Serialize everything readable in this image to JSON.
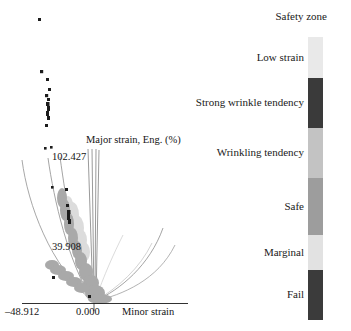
{
  "chart_data": {
    "type": "scatter",
    "title": "",
    "xlabel": "Minor strain",
    "ylabel": "Major strain, Eng. (%)",
    "axis_titles": {
      "x": "Minor strain",
      "y": "Major strain, Eng. (%)"
    },
    "x_ticks": [
      "–48.912",
      "0.000"
    ],
    "y_ticks": [
      "102.427",
      "39.908"
    ],
    "xlim": [
      -48.912,
      0.0
    ],
    "ylim": [
      0.0,
      102.427
    ],
    "grid": false,
    "legend_position": "right",
    "series": [
      {
        "name": "Fail (black points)",
        "color": "#1c1c1c",
        "points": [
          [
            -38.5,
            128.0
          ],
          [
            -36.0,
            94.0
          ],
          [
            -33.5,
            88.0
          ],
          [
            -35.5,
            80.0
          ],
          [
            -37.0,
            76.0
          ],
          [
            -36.0,
            72.0
          ],
          [
            -35.0,
            68.0
          ],
          [
            -36.5,
            64.0
          ],
          [
            -35.0,
            60.0
          ],
          [
            -34.5,
            101.0
          ],
          [
            -32.0,
            94.0
          ],
          [
            -25.0,
            62.0
          ],
          [
            -24.0,
            55.0
          ],
          [
            -23.0,
            52.0
          ],
          [
            -22.5,
            49.0
          ]
        ]
      },
      {
        "name": "Safe / Marginal (grey cloud)",
        "color": "#a8a8a8",
        "points": []
      },
      {
        "name": "Low strain (light grey cloud)",
        "color": "#d8d8d8",
        "points": []
      }
    ],
    "curves": [
      {
        "name": "forming limit curve outer",
        "color": "#8a8a8a"
      },
      {
        "name": "forming limit curve inner",
        "color": "#8a8a8a"
      },
      {
        "name": "marginal limit curve",
        "color": "#9a9a9a"
      },
      {
        "name": "wrinkle limit curve",
        "color": "#8a8a8a"
      },
      {
        "name": "strain path verticals",
        "color": "#6a6a6a"
      }
    ]
  },
  "plot": {
    "axis_title_major": "Major strain, Eng. (%)",
    "axis_title_minor": "Minor strain",
    "ytick_top": "102.427",
    "ytick_mid": "39.908",
    "xtick_min": "–48.912",
    "xtick_zero": "0.000"
  },
  "legend": {
    "title": "Safety zone",
    "bar_left_px": 76,
    "bar_width_px": 15,
    "segments": [
      {
        "label": "Low strain",
        "color": "#e9e9e9",
        "height_pct": 14.5
      },
      {
        "label": "Strong wrinkle tendency",
        "color": "#3a3a3a",
        "height_pct": 17.7
      },
      {
        "label": "Wrinkling tendency",
        "color": "#c3c3c3",
        "height_pct": 17.7
      },
      {
        "label": "Safe",
        "color": "#9d9d9d",
        "height_pct": 20.1
      },
      {
        "label": "Marginal",
        "color": "#e2e2e2",
        "height_pct": 12.4
      },
      {
        "label": "Fail",
        "color": "#3b3b3b",
        "height_pct": 17.6
      }
    ]
  }
}
